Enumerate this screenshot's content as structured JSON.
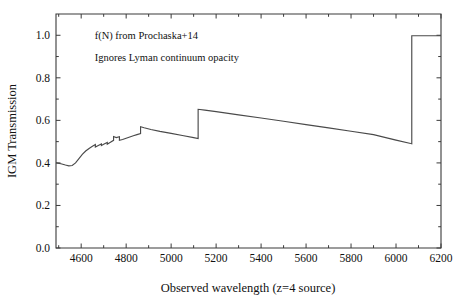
{
  "figure": {
    "annotations": [
      {
        "text": "f(N) from Prochaska+14",
        "x": 4660,
        "y": 1.0
      },
      {
        "text": "Ignores Lyman continuum opacity",
        "x": 4660,
        "y": 0.895
      }
    ]
  },
  "chart_data": {
    "type": "line",
    "title": "",
    "xlabel": "Observed wavelength (z=4 source)",
    "ylabel": "IGM Transmission",
    "xlim": [
      4488,
      6200
    ],
    "ylim": [
      0.0,
      1.1
    ],
    "xticks": [
      4600,
      4800,
      5000,
      5200,
      5400,
      5600,
      5800,
      6000,
      6200
    ],
    "xticklabels": [
      "4600",
      "4800",
      "5000",
      "5200",
      "5400",
      "5600",
      "5800",
      "6000",
      "6200"
    ],
    "yticks": [
      0.0,
      0.2,
      0.4,
      0.6,
      0.8,
      1.0
    ],
    "yticklabels": [
      "0.0",
      "0.2",
      "0.4",
      "0.6",
      "0.8",
      "1.0"
    ],
    "grid": false,
    "legend": null,
    "series": [
      {
        "name": "IGM transmission",
        "color": "#4a4a4a",
        "x": [
          4488,
          4510,
          4530,
          4545,
          4560,
          4575,
          4590,
          4605,
          4620,
          4635,
          4650,
          4663,
          4663,
          4676,
          4690,
          4690,
          4702,
          4716,
          4716,
          4730,
          4744,
          4744,
          4756,
          4770,
          4770,
          4784,
          4800,
          4816,
          4832,
          4848,
          4864,
          4864,
          4880,
          4910,
          4950,
          5000,
          5050,
          5100,
          5120,
          5120,
          5150,
          5200,
          5300,
          5400,
          5500,
          5600,
          5700,
          5800,
          5900,
          6000,
          6065,
          6070,
          6070,
          6120,
          6200
        ],
        "y": [
          0.4,
          0.396,
          0.39,
          0.386,
          0.388,
          0.4,
          0.42,
          0.44,
          0.456,
          0.468,
          0.478,
          0.486,
          0.475,
          0.482,
          0.489,
          0.482,
          0.489,
          0.496,
          0.488,
          0.497,
          0.506,
          0.524,
          0.519,
          0.523,
          0.506,
          0.51,
          0.516,
          0.522,
          0.528,
          0.533,
          0.538,
          0.57,
          0.565,
          0.557,
          0.548,
          0.539,
          0.529,
          0.519,
          0.515,
          0.652,
          0.648,
          0.641,
          0.626,
          0.611,
          0.596,
          0.58,
          0.565,
          0.549,
          0.533,
          0.507,
          0.491,
          0.49,
          0.998,
          0.998,
          0.998
        ]
      }
    ]
  }
}
